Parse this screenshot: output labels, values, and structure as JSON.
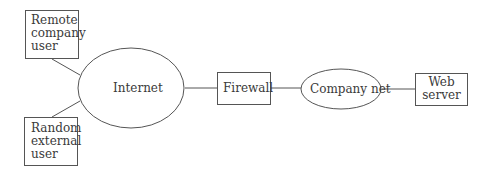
{
  "diagram": {
    "nodes": [
      {
        "id": "remote-user",
        "shape": "box",
        "label": [
          "Remote",
          "company",
          "user"
        ]
      },
      {
        "id": "random-user",
        "shape": "box",
        "label": [
          "Random",
          "external",
          "user"
        ]
      },
      {
        "id": "internet",
        "shape": "ellipse",
        "label": "Internet"
      },
      {
        "id": "firewall",
        "shape": "box",
        "label": "Firewall"
      },
      {
        "id": "company-net",
        "shape": "ellipse",
        "label": "Company net"
      },
      {
        "id": "web-server",
        "shape": "box",
        "label": [
          "Web",
          "server"
        ]
      }
    ],
    "edges": [
      [
        "remote-user",
        "internet"
      ],
      [
        "random-user",
        "internet"
      ],
      [
        "internet",
        "firewall"
      ],
      [
        "firewall",
        "company-net"
      ],
      [
        "company-net",
        "web-server"
      ]
    ]
  },
  "labels": {
    "remote_1": "Remote",
    "remote_2": "company",
    "remote_3": "user",
    "random_1": "Random",
    "random_2": "external",
    "random_3": "user",
    "internet": "Internet",
    "firewall": "Firewall",
    "company_net": "Company net",
    "web_1": "Web",
    "web_2": "server"
  },
  "colors": {
    "stroke": "#555555",
    "text": "#3a3a3a",
    "background": "#ffffff"
  }
}
